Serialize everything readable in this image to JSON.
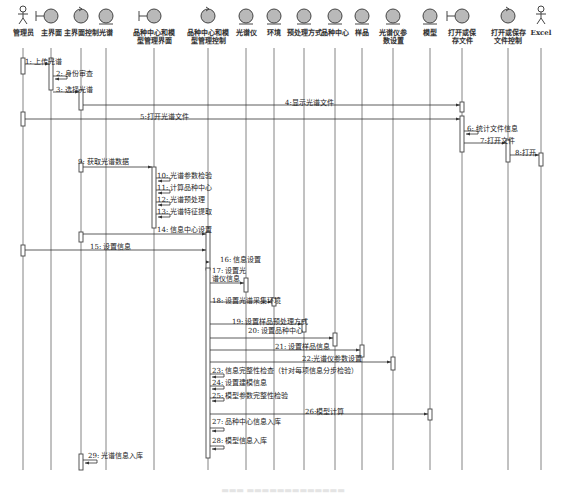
{
  "diagram": {
    "type": "sequence",
    "participants": [
      {
        "id": "admin",
        "label": "管理员",
        "kind": "actor",
        "x": 10
      },
      {
        "id": "main_ui",
        "label": "主界面",
        "kind": "boundary",
        "x": 50
      },
      {
        "id": "main_ctrl",
        "label": "主界面控制",
        "kind": "control",
        "x": 85
      },
      {
        "id": "spectrum",
        "label": "光谱",
        "kind": "entity",
        "x": 114
      },
      {
        "id": "center_ui",
        "label": "品种中心和模型管理界面",
        "kind": "boundary",
        "x": 155
      },
      {
        "id": "center_ctrl",
        "label": "品种中心和模型管理控制",
        "kind": "control",
        "x": 210
      },
      {
        "id": "instrument",
        "label": "光谱仪",
        "kind": "entity",
        "x": 246
      },
      {
        "id": "environment",
        "label": "环境",
        "kind": "entity",
        "x": 273
      },
      {
        "id": "preprocess",
        "label": "预处理方式",
        "kind": "entity",
        "x": 304
      },
      {
        "id": "variety_center",
        "label": "品种中心",
        "kind": "entity",
        "x": 335
      },
      {
        "id": "sample",
        "label": "样品",
        "kind": "entity",
        "x": 362
      },
      {
        "id": "inst_params",
        "label": "光谱仪参数设置",
        "kind": "entity",
        "x": 393
      },
      {
        "id": "model",
        "label": "模型",
        "kind": "entity",
        "x": 430
      },
      {
        "id": "file_ui",
        "label": "打开或保存文件",
        "kind": "boundary",
        "x": 463
      },
      {
        "id": "file_ctrl",
        "label": "打开或保存文件控制",
        "kind": "control",
        "x": 508
      },
      {
        "id": "excel",
        "label": "Excel",
        "kind": "actor",
        "x": 541
      }
    ],
    "messages": [
      {
        "n": "1",
        "label": "1: 上传光谱",
        "from": "admin",
        "to": "main_ui",
        "y": 64
      },
      {
        "n": "2",
        "label": "2: 身份审查",
        "from": "main_ui",
        "to": "main_ui",
        "y": 76,
        "self": true
      },
      {
        "n": "3",
        "label": "3: 选择光谱",
        "from": "main_ui",
        "to": "main_ctrl",
        "y": 92
      },
      {
        "n": "4",
        "label": "4:显示光谱文件",
        "from": "main_ctrl",
        "to": "file_ui",
        "y": 105
      },
      {
        "n": "5",
        "label": "5:打开光谱文件",
        "from": "admin",
        "to": "file_ui",
        "y": 119
      },
      {
        "n": "6",
        "label": "6: 统计文件信息",
        "from": "file_ui",
        "to": "file_ui",
        "y": 131,
        "self": true
      },
      {
        "n": "7",
        "label": "7:打开文件",
        "from": "file_ui",
        "to": "file_ctrl",
        "y": 143
      },
      {
        "n": "8",
        "label": "8:打开",
        "from": "file_ctrl",
        "to": "excel",
        "y": 155
      },
      {
        "n": "9",
        "label": "9: 获取光谱数据",
        "from": "main_ctrl",
        "to": "center_ui",
        "y": 167
      },
      {
        "n": "10",
        "label": "10: 光谱参数检验",
        "from": "center_ui",
        "to": "center_ui",
        "y": 178,
        "self": true
      },
      {
        "n": "11",
        "label": "11: 计算品种中心",
        "from": "center_ui",
        "to": "center_ui",
        "y": 190,
        "self": true
      },
      {
        "n": "12",
        "label": "12: 光谱预处理",
        "from": "center_ui",
        "to": "center_ui",
        "y": 202,
        "self": true
      },
      {
        "n": "13",
        "label": "13: 光谱特征提取",
        "from": "center_ui",
        "to": "center_ui",
        "y": 214,
        "self": true
      },
      {
        "n": "14",
        "label": "14: 信息中心设置",
        "from": "main_ctrl",
        "to": "center_ctrl",
        "y": 234
      },
      {
        "n": "15",
        "label": "15: 设置信息",
        "from": "admin",
        "to": "center_ctrl",
        "y": 250
      },
      {
        "n": "16",
        "label": "16: 信息设置",
        "from": "center_ctrl",
        "to": "center_ctrl_right",
        "y": 262
      },
      {
        "n": "17",
        "label": "17: 设置光谱仪信息",
        "from": "center_ctrl2",
        "to": "instrument",
        "y": 283
      },
      {
        "n": "18",
        "label": "18: 设置光谱采集环境",
        "from": "center_ctrl2",
        "to": "environment",
        "y": 302
      },
      {
        "n": "19",
        "label": "19: 设置样品预处理方式",
        "from": "center_ctrl2",
        "to": "preprocess",
        "y": 324
      },
      {
        "n": "20",
        "label": "20: 设置品种中心",
        "from": "center_ctrl2",
        "to": "variety_center",
        "y": 338
      },
      {
        "n": "21",
        "label": "21: 设置样品信息",
        "from": "center_ctrl2",
        "to": "sample",
        "y": 350
      },
      {
        "n": "22",
        "label": "22:光谱仪参数设置",
        "from": "center_ctrl2",
        "to": "inst_params",
        "y": 362
      },
      {
        "n": "23",
        "label": "23: 信息完整性检查（针对每项信息分步检验）",
        "from": "center_ctrl2",
        "to": "center_ctrl2",
        "y": 374,
        "self": true
      },
      {
        "n": "24",
        "label": "24: 设置建模信息",
        "from": "center_ctrl2",
        "to": "center_ctrl2",
        "y": 386,
        "self": true
      },
      {
        "n": "25",
        "label": "25: 模型参数完整性检验",
        "from": "center_ctrl2",
        "to": "center_ctrl2",
        "y": 398,
        "self": true
      },
      {
        "n": "26",
        "label": "26:模型计算",
        "from": "center_ctrl2",
        "to": "model",
        "y": 414
      },
      {
        "n": "27",
        "label": "27: 品种中心信息入库",
        "from": "center_ctrl2",
        "to": "center_ctrl2",
        "y": 428,
        "self": true
      },
      {
        "n": "28",
        "label": "28: 模型信息入库",
        "from": "center_ctrl2",
        "to": "center_ctrl2",
        "y": 446,
        "self": true
      },
      {
        "n": "29",
        "label": "29: 光谱信息入库",
        "from": "main_ctrl",
        "to": "main_ctrl",
        "y": 460,
        "self": true
      }
    ]
  },
  "colors": {
    "line": "#555555",
    "lifeline": "#666666",
    "icon_fill": "#b9b9b9",
    "icon_stroke": "#444444",
    "activation_fill": "#ffffff"
  }
}
